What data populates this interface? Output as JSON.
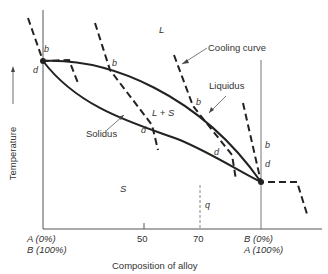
{
  "diagram": {
    "type": "binary-isomorphous-phase-diagram",
    "axes": {
      "y_label": "Temperature",
      "x_label": "Composition of alloy",
      "x_left_label_line1": "A (0%)",
      "x_left_label_line2": "B (100%)",
      "x_right_label_line1": "B (0%)",
      "x_right_label_line2": "A (100%)",
      "x_ticks": [
        "50",
        "70"
      ]
    },
    "regions": {
      "liquid": "L",
      "two_phase": "L + S",
      "solid": "S"
    },
    "curves": {
      "liquidus": "Liquidus",
      "solidus": "Solidus",
      "cooling": "Cooling curve"
    },
    "points": {
      "b": "b",
      "d": "d",
      "q": "q"
    }
  }
}
